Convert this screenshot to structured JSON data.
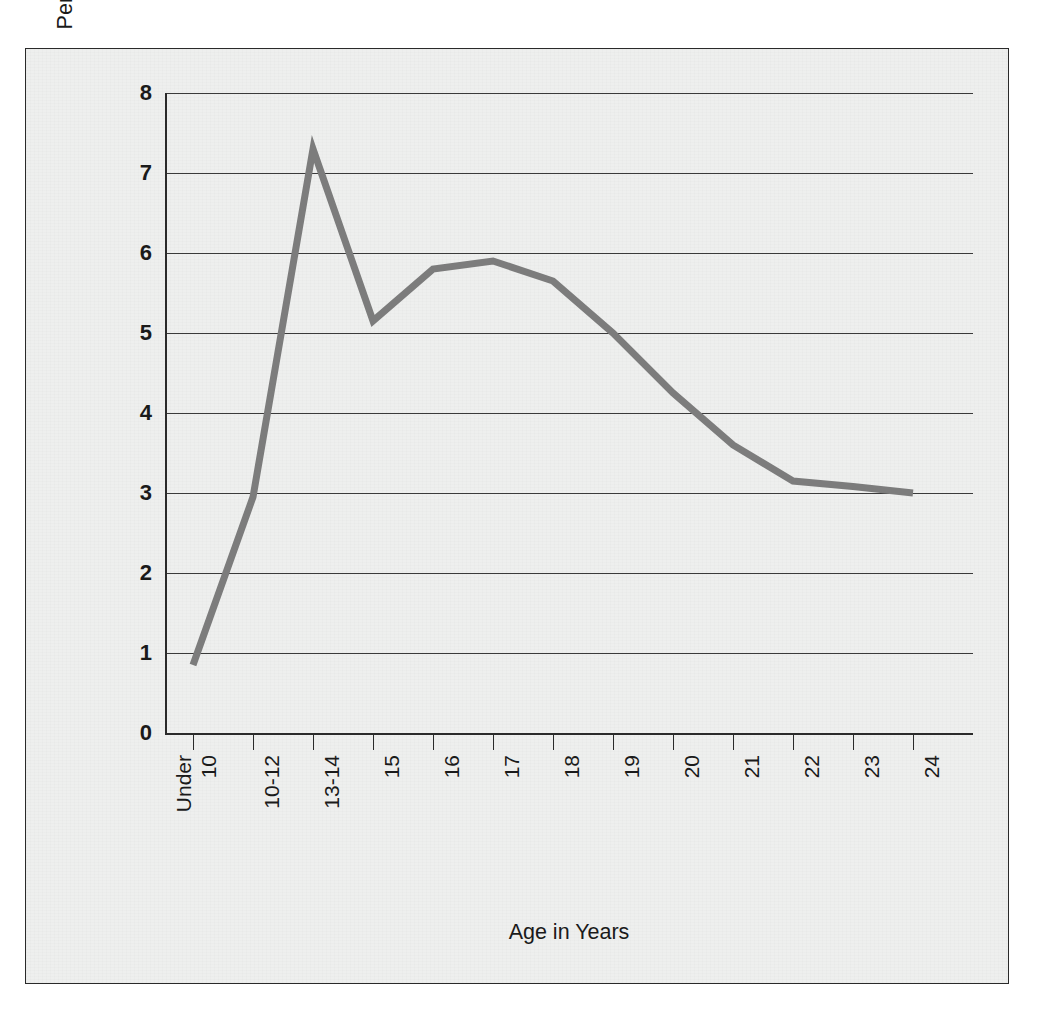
{
  "chart_data": {
    "type": "line",
    "title": "",
    "xlabel": "Age in Years",
    "ylabel": "Percentage of Age Group Arrested for Delinquency",
    "categories": [
      "Under 10",
      "10-12",
      "13-14",
      "15",
      "16",
      "17",
      "18",
      "19",
      "20",
      "21",
      "22",
      "23",
      "24"
    ],
    "values": [
      0.85,
      2.95,
      7.3,
      5.15,
      5.8,
      5.9,
      5.65,
      5.0,
      4.25,
      3.6,
      3.15,
      3.08,
      3.0
    ],
    "series": [
      {
        "name": "Percentage of Age Group Arrested for Delinquency",
        "values": [
          0.85,
          2.95,
          7.3,
          5.15,
          5.8,
          5.9,
          5.65,
          5.0,
          4.25,
          3.6,
          3.15,
          3.08,
          3.0
        ]
      }
    ],
    "ylim": [
      0,
      8
    ],
    "yticks": [
      0,
      1,
      2,
      3,
      4,
      5,
      6,
      7,
      8
    ],
    "ytick_labels": [
      "0",
      "1",
      "2",
      "3",
      "4",
      "5",
      "6",
      "7",
      "8"
    ],
    "grid": "horizontal",
    "legend": "none",
    "line_color": "#7c7c7c",
    "gridline_color": "#3a3a3a",
    "axis_color": "#2a2a2a",
    "plot_background": "#eeefee"
  },
  "axis": {
    "x_title": "Age in Years",
    "y_title": "Percentage of Age Group Arrested for Delinquency"
  },
  "xtick_labels": [
    {
      "line1": "Under",
      "line2": "10"
    },
    {
      "line1": "10-12",
      "line2": ""
    },
    {
      "line1": "13-14",
      "line2": ""
    },
    {
      "line1": "15",
      "line2": ""
    },
    {
      "line1": "16",
      "line2": ""
    },
    {
      "line1": "17",
      "line2": ""
    },
    {
      "line1": "18",
      "line2": ""
    },
    {
      "line1": "19",
      "line2": ""
    },
    {
      "line1": "20",
      "line2": ""
    },
    {
      "line1": "21",
      "line2": ""
    },
    {
      "line1": "22",
      "line2": ""
    },
    {
      "line1": "23",
      "line2": ""
    },
    {
      "line1": "24",
      "line2": ""
    }
  ]
}
